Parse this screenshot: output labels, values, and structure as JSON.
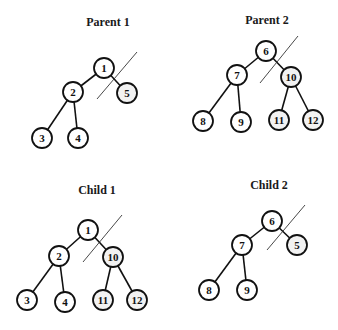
{
  "diagram": {
    "type": "tree-crossover",
    "colors": {
      "stroke": "#111111",
      "node_fill": "#ffffff",
      "swapped_fill": "#f2f2f2",
      "background": "#ffffff"
    },
    "trees": [
      {
        "id": "parent1",
        "title": "Parent 1",
        "title_pos": [
          108,
          26
        ],
        "nodes": [
          {
            "label": "1",
            "x": 104,
            "y": 68,
            "swapped": false
          },
          {
            "label": "2",
            "x": 73,
            "y": 92,
            "swapped": false
          },
          {
            "label": "5",
            "x": 127,
            "y": 93,
            "swapped": true
          },
          {
            "label": "3",
            "x": 42,
            "y": 138,
            "swapped": false
          },
          {
            "label": "4",
            "x": 78,
            "y": 138,
            "swapped": false
          }
        ],
        "edges": [
          [
            "1",
            "2"
          ],
          [
            "1",
            "5"
          ],
          [
            "2",
            "3"
          ],
          [
            "2",
            "4"
          ]
        ],
        "cut": [
          97,
          99,
          137,
          52
        ]
      },
      {
        "id": "parent2",
        "title": "Parent 2",
        "title_pos": [
          267,
          24
        ],
        "nodes": [
          {
            "label": "6",
            "x": 266,
            "y": 51,
            "swapped": false
          },
          {
            "label": "7",
            "x": 237,
            "y": 75,
            "swapped": false
          },
          {
            "label": "10",
            "x": 291,
            "y": 77,
            "swapped": true
          },
          {
            "label": "8",
            "x": 203,
            "y": 121,
            "swapped": false
          },
          {
            "label": "9",
            "x": 241,
            "y": 122,
            "swapped": false
          },
          {
            "label": "11",
            "x": 279,
            "y": 120,
            "swapped": true
          },
          {
            "label": "12",
            "x": 313,
            "y": 120,
            "swapped": true
          }
        ],
        "edges": [
          [
            "6",
            "7"
          ],
          [
            "6",
            "10"
          ],
          [
            "7",
            "8"
          ],
          [
            "7",
            "9"
          ],
          [
            "10",
            "11"
          ],
          [
            "10",
            "12"
          ]
        ],
        "cut": [
          260,
          83,
          298,
          36
        ]
      },
      {
        "id": "child1",
        "title": "Child 1",
        "title_pos": [
          97,
          194
        ],
        "nodes": [
          {
            "label": "1",
            "x": 88,
            "y": 230,
            "swapped": false
          },
          {
            "label": "2",
            "x": 59,
            "y": 256,
            "swapped": false
          },
          {
            "label": "10",
            "x": 113,
            "y": 257,
            "swapped": true
          },
          {
            "label": "3",
            "x": 27,
            "y": 300,
            "swapped": false
          },
          {
            "label": "4",
            "x": 65,
            "y": 302,
            "swapped": false
          },
          {
            "label": "11",
            "x": 103,
            "y": 300,
            "swapped": true
          },
          {
            "label": "12",
            "x": 137,
            "y": 300,
            "swapped": true
          }
        ],
        "edges": [
          [
            "1",
            "2"
          ],
          [
            "1",
            "10"
          ],
          [
            "2",
            "3"
          ],
          [
            "2",
            "4"
          ],
          [
            "10",
            "11"
          ],
          [
            "10",
            "12"
          ]
        ],
        "cut": [
          83,
          262,
          122,
          215
        ]
      },
      {
        "id": "child2",
        "title": "Child 2",
        "title_pos": [
          269,
          189
        ],
        "nodes": [
          {
            "label": "6",
            "x": 272,
            "y": 221,
            "swapped": false
          },
          {
            "label": "7",
            "x": 242,
            "y": 245,
            "swapped": false
          },
          {
            "label": "5",
            "x": 297,
            "y": 245,
            "swapped": true
          },
          {
            "label": "8",
            "x": 209,
            "y": 290,
            "swapped": false
          },
          {
            "label": "9",
            "x": 247,
            "y": 290,
            "swapped": false
          }
        ],
        "edges": [
          [
            "6",
            "7"
          ],
          [
            "6",
            "5"
          ],
          [
            "7",
            "8"
          ],
          [
            "7",
            "9"
          ]
        ],
        "cut": [
          267,
          250,
          305,
          205
        ]
      }
    ],
    "node_radius": 10
  }
}
